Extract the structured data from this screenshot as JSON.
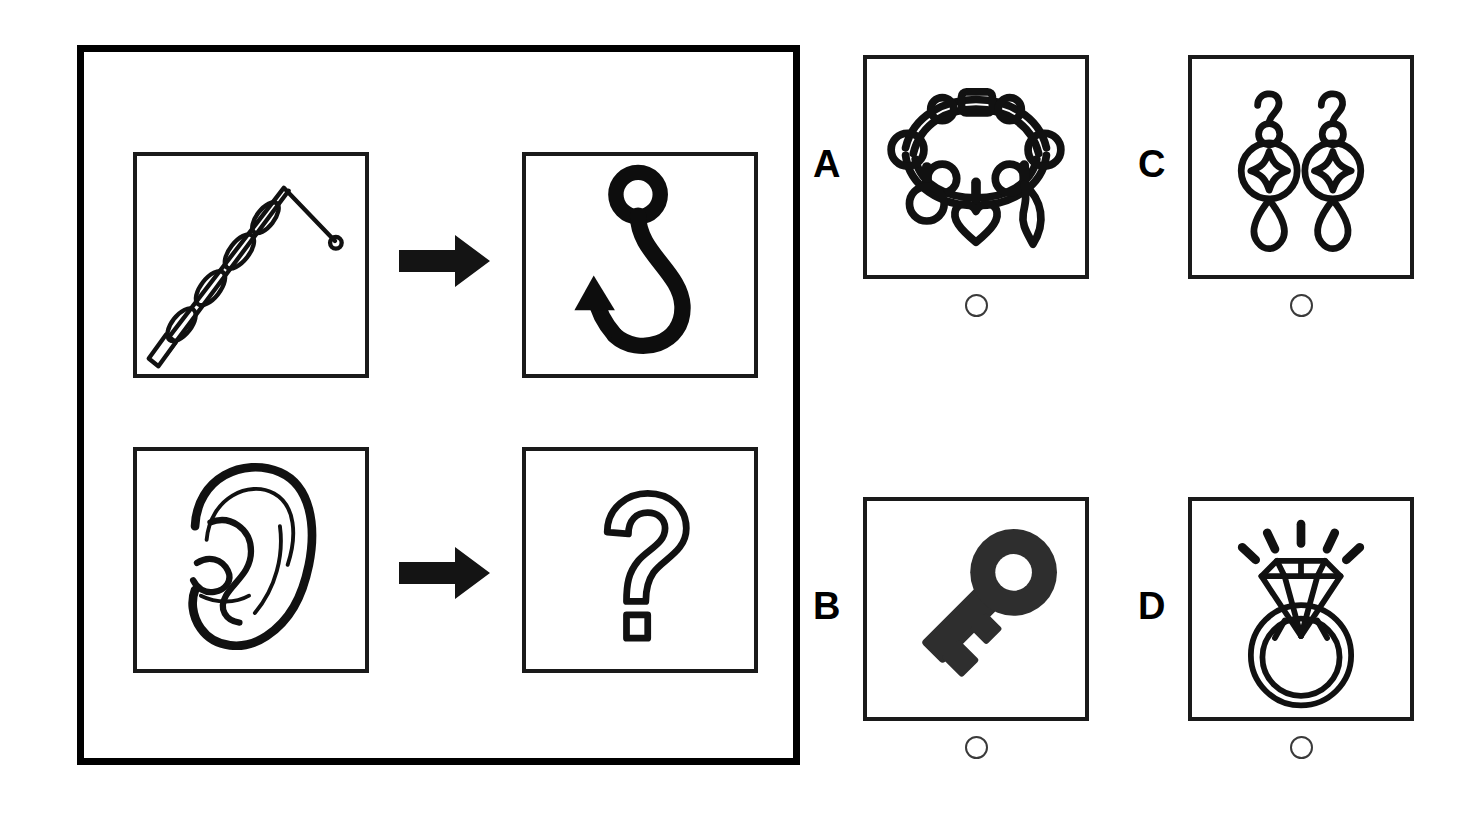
{
  "puzzle": {
    "type": "visual-analogy-multiple-choice",
    "prompt_row_1": {
      "source_label": "fishing rod",
      "relation_label": "leads to",
      "target_label": "fish hook"
    },
    "prompt_row_2": {
      "source_label": "ear",
      "relation_label": "leads to",
      "target_label": "unknown"
    },
    "unknown_glyph": "?"
  },
  "stimulus": {
    "cells": [
      {
        "name": "fishing-rod",
        "label": "fishing rod",
        "style": "outline"
      },
      {
        "name": "fish-hook",
        "label": "fish hook",
        "style": "solid"
      },
      {
        "name": "ear",
        "label": "ear",
        "style": "outline"
      },
      {
        "name": "question",
        "label": "question mark",
        "style": "outline"
      }
    ],
    "arrows": [
      {
        "name": "arrow-row-1",
        "direction": "right"
      },
      {
        "name": "arrow-row-2",
        "direction": "right"
      }
    ]
  },
  "options": [
    {
      "letter": "A",
      "label": "charm bracelet",
      "selected": false
    },
    {
      "letter": "B",
      "label": "key",
      "selected": false
    },
    {
      "letter": "C",
      "label": "earrings",
      "selected": false
    },
    {
      "letter": "D",
      "label": "diamond ring",
      "selected": false
    }
  ],
  "colors": {
    "ink": "#000000",
    "line": "#1a1a1a",
    "radio_stroke": "#3a3a3a",
    "background": "#ffffff"
  }
}
